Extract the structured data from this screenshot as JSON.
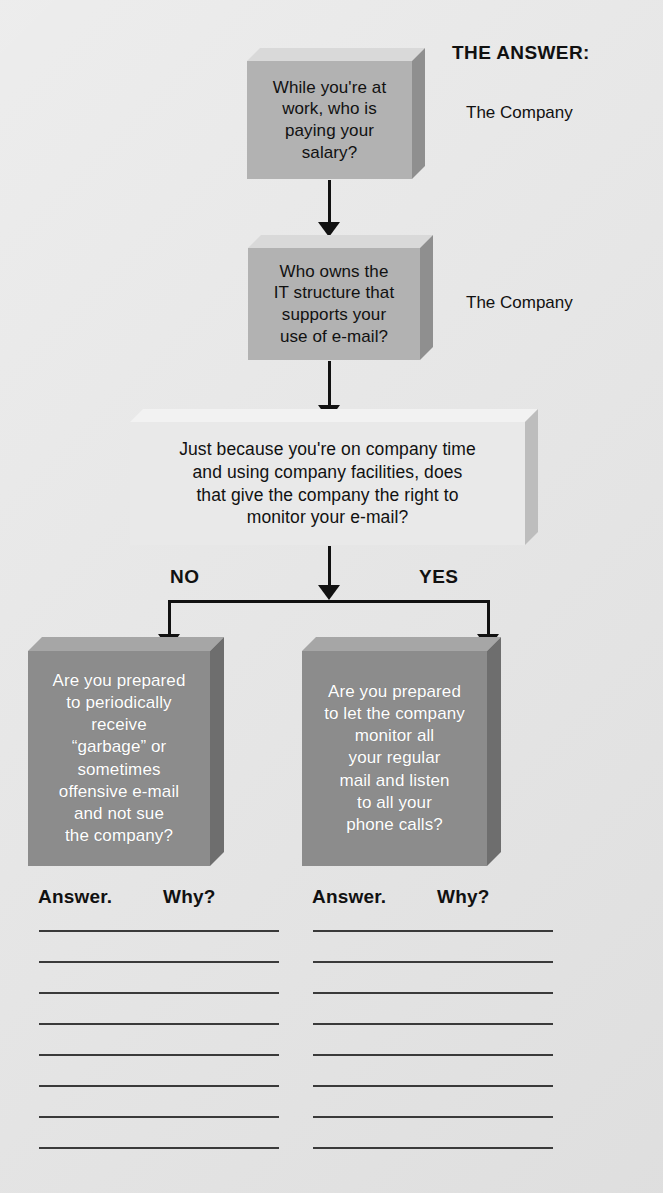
{
  "page": {
    "background_color": "#e3e3e3"
  },
  "answer_column": {
    "heading": "THE ANSWER:",
    "answers": [
      {
        "text": "The Company"
      },
      {
        "text": "The Company"
      }
    ]
  },
  "flow": {
    "nodes": [
      {
        "id": "q1",
        "style": "medium",
        "text": "While you're at\nwork, who is\npaying your\nsalary?"
      },
      {
        "id": "q2",
        "style": "medium",
        "text": "Who owns the\nIT structure that\nsupports your\nuse of e-mail?"
      },
      {
        "id": "q3",
        "style": "light",
        "text": "Just because you're on company time\nand using company facilities, does\nthat give the company the right to\nmonitor your e-mail?"
      },
      {
        "id": "q4-no",
        "style": "dark",
        "text": "Are you prepared\nto periodically\nreceive\n“garbage” or\nsometimes\noffensive e-mail\nand not sue\nthe company?"
      },
      {
        "id": "q4-yes",
        "style": "dark",
        "text": "Are you prepared\nto let the company\nmonitor all\nyour regular\nmail and listen\nto all your\nphone calls?"
      }
    ],
    "branches": {
      "left_label": "NO",
      "right_label": "YES"
    }
  },
  "worksheets": [
    {
      "id": "left",
      "answer_label": "Answer.",
      "why_label": "Why?",
      "line_count": 8
    },
    {
      "id": "right",
      "answer_label": "Answer.",
      "why_label": "Why?",
      "line_count": 8
    }
  ],
  "colors": {
    "ink": "#111111",
    "medium_box": "#b2b2b2",
    "light_box": "#e9e9e9",
    "dark_box": "#8c8c8c",
    "dark_box_text": "#ffffff"
  }
}
